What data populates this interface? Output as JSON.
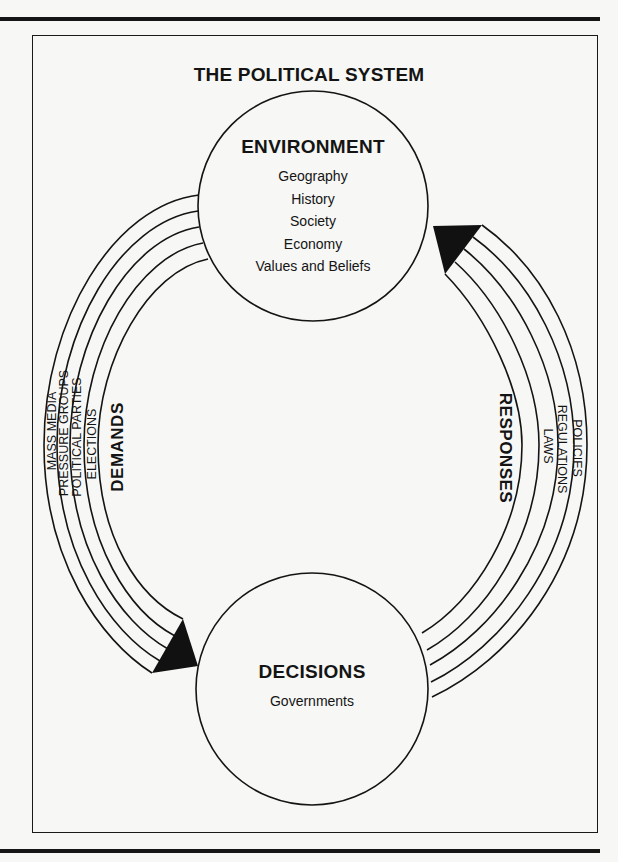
{
  "title": "THE POLITICAL SYSTEM",
  "environment": {
    "heading": "ENVIRONMENT",
    "items": [
      "Geography",
      "History",
      "Society",
      "Economy",
      "Values and Beliefs"
    ]
  },
  "decisions": {
    "heading": "DECISIONS",
    "items": [
      "Governments"
    ]
  },
  "demands": {
    "label": "DEMANDS",
    "channels": [
      "MASS MEDIA",
      "PRESSURE GROUPS",
      "POLITICAL PARTIES",
      "ELECTIONS"
    ]
  },
  "responses": {
    "label": "RESPONSES",
    "channels": [
      "POLICIES",
      "REGULATIONS",
      "LAWS"
    ]
  },
  "colors": {
    "ink": "#141414",
    "paper": "#f7f7f5"
  }
}
